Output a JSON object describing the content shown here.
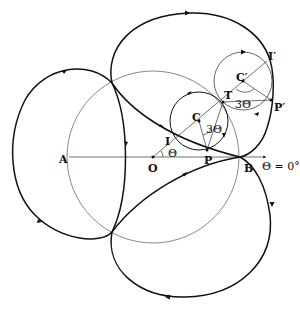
{
  "diagram": {
    "colors": {
      "curve": "#111111",
      "construction": "#555555",
      "background": "#ffffff"
    },
    "points": {
      "A": "A",
      "O": "O",
      "B": "B",
      "P": "P",
      "I": "I",
      "C": "C",
      "T": "T",
      "C_prime": "C′",
      "I_prime": "I′",
      "P_prime": "P′"
    },
    "angles": {
      "theta": "Θ",
      "three_theta_1": "3Θ",
      "three_theta_2": "3Θ"
    },
    "axis_label": "Θ = 0°"
  }
}
